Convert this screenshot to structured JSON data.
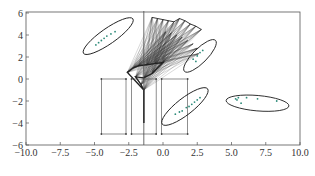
{
  "chart_data": {
    "type": "scatter",
    "title": "",
    "xlabel": "",
    "ylabel": "",
    "xlim": [
      -10.0,
      10.0
    ],
    "ylim": [
      -6,
      6
    ],
    "grid": false,
    "legend": null,
    "x_ticks": [
      -10.0,
      -7.5,
      -5.0,
      -2.5,
      0.0,
      2.5,
      5.0,
      7.5,
      10.0
    ],
    "x_tick_labels": [
      "−10.0",
      "−7.5",
      "−5.0",
      "−2.5",
      "0.0",
      "2.5",
      "5.0",
      "7.5",
      "10.0"
    ],
    "y_ticks": [
      6,
      4,
      2,
      0,
      -2,
      -4,
      -6
    ],
    "y_tick_labels": [
      "6",
      "4",
      "2",
      "0",
      "−2",
      "−4",
      "−6"
    ],
    "colors": {
      "axis": "#555555",
      "points": "#2e8b7a",
      "ellipse": "#222222",
      "lines": "#333333",
      "boxes": "#444444"
    },
    "vertical_line": {
      "x": -1.4,
      "y_from": -6,
      "y_to": 6.5
    },
    "clusters": [
      {
        "name": "cluster-upper-left",
        "ellipse": {
          "cx": -4.0,
          "cy": 3.9,
          "rx": 2.2,
          "ry": 0.7,
          "angle_deg": 35
        },
        "points": [
          [
            -4.9,
            3.1
          ],
          [
            -4.7,
            3.3
          ],
          [
            -4.5,
            3.5
          ],
          [
            -4.3,
            3.7
          ],
          [
            -4.1,
            3.9
          ],
          [
            -3.8,
            4.1
          ],
          [
            -3.5,
            4.3
          ]
        ]
      },
      {
        "name": "cluster-upper-right",
        "ellipse": {
          "cx": 2.7,
          "cy": 2.1,
          "rx": 1.6,
          "ry": 0.65,
          "angle_deg": 45
        },
        "points": [
          [
            2.2,
            1.8
          ],
          [
            2.5,
            2.1
          ],
          [
            2.7,
            2.4
          ],
          [
            2.9,
            2.6
          ],
          [
            2.4,
            1.6
          ]
        ]
      },
      {
        "name": "cluster-lower-middle",
        "ellipse": {
          "cx": 1.6,
          "cy": -2.5,
          "rx": 2.1,
          "ry": 0.75,
          "angle_deg": 38
        },
        "points": [
          [
            0.9,
            -3.2
          ],
          [
            1.2,
            -3.0
          ],
          [
            1.4,
            -2.9
          ],
          [
            1.7,
            -2.6
          ],
          [
            1.9,
            -2.5
          ],
          [
            2.1,
            -2.3
          ],
          [
            2.3,
            -2.1
          ],
          [
            2.5,
            -1.9
          ],
          [
            2.7,
            -1.7
          ]
        ]
      },
      {
        "name": "cluster-right",
        "ellipse": {
          "cx": 6.9,
          "cy": -2.2,
          "rx": 2.3,
          "ry": 0.7,
          "angle_deg": -5
        },
        "points": [
          [
            5.3,
            -1.8
          ],
          [
            5.4,
            -1.9
          ],
          [
            5.5,
            -1.7
          ],
          [
            5.7,
            -2.2
          ],
          [
            6.1,
            -1.7
          ],
          [
            6.9,
            -1.8
          ],
          [
            8.3,
            -2.0
          ]
        ]
      }
    ],
    "boxes": [
      {
        "x0": -4.5,
        "x1": -2.7,
        "y0": -5,
        "y1": 0
      },
      {
        "x0": -2.3,
        "x1": -0.5,
        "y0": -5,
        "y1": 0
      },
      {
        "x0": -0.1,
        "x1": 1.8,
        "y0": -5,
        "y1": 0
      }
    ],
    "fan": {
      "base": [
        [
          -2.6,
          0.6
        ],
        [
          -2.2,
          1.0
        ],
        [
          -1.8,
          1.2
        ],
        [
          -1.2,
          1.3
        ],
        [
          -0.6,
          1.4
        ],
        [
          0.0,
          1.5
        ],
        [
          -0.8,
          0.5
        ],
        [
          -1.4,
          0.1
        ],
        [
          -2.0,
          0.2
        ],
        [
          -1.6,
          -0.5
        ],
        [
          -1.4,
          -1.0
        ]
      ],
      "tips": [
        [
          -0.8,
          5.6
        ],
        [
          -0.4,
          5.5
        ],
        [
          0.0,
          5.4
        ],
        [
          0.4,
          5.3
        ],
        [
          0.8,
          5.2
        ],
        [
          1.2,
          5.5
        ],
        [
          1.6,
          5.3
        ],
        [
          2.0,
          5.0
        ],
        [
          2.4,
          4.8
        ],
        [
          2.8,
          4.5
        ],
        [
          0.2,
          4.3
        ],
        [
          0.6,
          4.2
        ],
        [
          1.0,
          4.0
        ],
        [
          1.4,
          3.8
        ],
        [
          1.8,
          3.5
        ],
        [
          2.2,
          3.2
        ],
        [
          2.5,
          2.8
        ],
        [
          2.6,
          2.3
        ]
      ]
    }
  }
}
